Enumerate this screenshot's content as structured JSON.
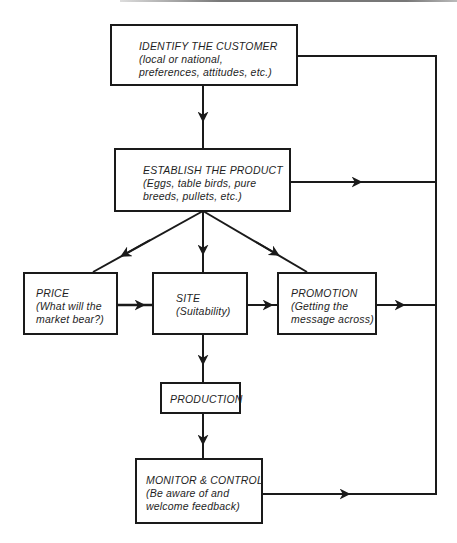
{
  "diagram": {
    "type": "flowchart",
    "nodes": [
      {
        "id": "identify",
        "title": "IDENTIFY THE CUSTOMER",
        "lines": [
          "(local or national,",
          "preferences, attitudes, etc.)"
        ]
      },
      {
        "id": "establish",
        "title": "ESTABLISH THE PRODUCT",
        "lines": [
          "(Eggs, table birds, pure",
          "breeds, pullets, etc.)"
        ]
      },
      {
        "id": "price",
        "title": "PRICE",
        "lines": [
          "(What will the",
          "market bear?)"
        ]
      },
      {
        "id": "site",
        "title": "SITE",
        "lines": [
          "(Suitability)"
        ]
      },
      {
        "id": "promotion",
        "title": "PROMOTION",
        "lines": [
          "(Getting the",
          "message across)"
        ]
      },
      {
        "id": "production",
        "title": "PRODUCTION",
        "lines": []
      },
      {
        "id": "monitor",
        "title": "MONITOR & CONTROL",
        "lines": [
          "(Be aware of and",
          "welcome feedback)"
        ]
      }
    ],
    "edges": [
      {
        "from": "identify",
        "to": "establish"
      },
      {
        "from": "establish",
        "to": "price"
      },
      {
        "from": "establish",
        "to": "site"
      },
      {
        "from": "establish",
        "to": "promotion"
      },
      {
        "from": "price",
        "to": "site"
      },
      {
        "from": "site",
        "to": "promotion"
      },
      {
        "from": "site",
        "to": "production"
      },
      {
        "from": "production",
        "to": "monitor"
      },
      {
        "from": "identify",
        "to": "feedback-loop"
      },
      {
        "from": "establish",
        "to": "feedback-loop"
      },
      {
        "from": "promotion",
        "to": "feedback-loop"
      },
      {
        "from": "monitor",
        "to": "feedback-loop"
      }
    ],
    "colors": {
      "line": "#1a1a1a",
      "background": "#ffffff"
    }
  }
}
